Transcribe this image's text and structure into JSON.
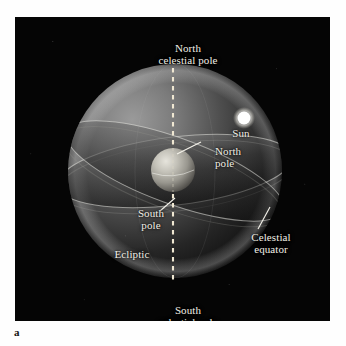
{
  "figure": {
    "caption_letter": "a",
    "panel_background": "#050505",
    "page_background": "#fefefe"
  },
  "diagram": {
    "type": "celestial-sphere",
    "title_labels": {
      "north_celestial_pole_line1": "North",
      "north_celestial_pole_line2": "celestial pole",
      "south_celestial_pole_line1": "South",
      "south_celestial_pole_line2": "celestial pole"
    },
    "labels": [
      {
        "id": "north-celestial-pole",
        "line1": "North",
        "line2": "celestial pole"
      },
      {
        "id": "sun",
        "line1": "Sun",
        "line2": ""
      },
      {
        "id": "north-pole",
        "line1": "North",
        "line2": "pole"
      },
      {
        "id": "south-pole",
        "line1": "South",
        "line2": "pole"
      },
      {
        "id": "ecliptic",
        "line1": "Ecliptic",
        "line2": ""
      },
      {
        "id": "celestial-equator",
        "line1": "Celestial",
        "line2": "equator"
      },
      {
        "id": "south-celestial-pole",
        "line1": "South",
        "line2": "celestial pole"
      }
    ],
    "objects": {
      "celestial_sphere": {
        "center_x": 160,
        "center_y": 154,
        "radius": 107
      },
      "earth": {
        "center_x": 158,
        "center_y": 153,
        "radius": 22
      },
      "sun": {
        "center_x": 229,
        "center_y": 101,
        "radius": 7,
        "color": "#ffffff"
      },
      "rotation_axis": {
        "style": "dashed",
        "color": "#efe7d2",
        "x": 158,
        "y_top": 51,
        "y_bottom": 263
      }
    },
    "colors": {
      "sphere_highlight": "#c9c9c9",
      "sphere_shadow": "#0d0d0d",
      "label_text": "#f2efe6",
      "axis_dash": "#efe7d2",
      "leader_line": "#ffffff",
      "earth_highlight": "#d8d8d0",
      "sun_glow": "#ffffff"
    }
  }
}
